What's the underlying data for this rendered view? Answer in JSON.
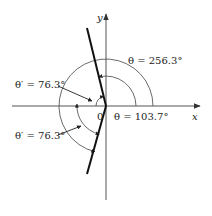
{
  "diagram": {
    "type": "angle-diagram",
    "axes": {
      "x_label": "x",
      "y_label": "y",
      "origin_label": "0"
    },
    "line": {
      "description": "thick line through origin",
      "angle_deg": 103.7
    },
    "annotations": [
      {
        "id": "theta-256",
        "text": "θ = 256.3°",
        "symbol": "θ",
        "value": "256.3°"
      },
      {
        "id": "theta-103",
        "text": "θ = 103.7°",
        "symbol": "θ",
        "value": "103.7°"
      },
      {
        "id": "theta-prime-upper",
        "text": "θ′ = 76.3°",
        "symbol": "θ′",
        "value": "76.3°"
      },
      {
        "id": "theta-prime-lower",
        "text": "θ′ = 76.3°",
        "symbol": "θ′",
        "value": "76.3°"
      }
    ],
    "colors": {
      "stroke": "#222222",
      "axis": "#555555",
      "background": "#ffffff"
    }
  }
}
